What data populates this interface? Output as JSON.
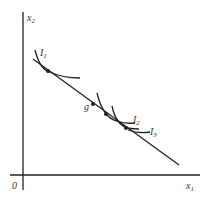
{
  "diagram": {
    "axes": {
      "y_label": "x",
      "y_sub": "2",
      "x_label": "x",
      "x_sub": "1",
      "origin": "0"
    },
    "curves": [
      {
        "label": "I",
        "sub": "1"
      },
      {
        "label": "I",
        "sub": "2"
      },
      {
        "label": "I",
        "sub": "3"
      }
    ],
    "point_label": "g",
    "colors": {
      "line": "#222222",
      "text": "#333333"
    }
  }
}
